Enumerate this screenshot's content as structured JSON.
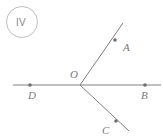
{
  "figure": {
    "label_badge": "IV",
    "kind": "geometry-angle-diagram",
    "stroke_color": "#808080",
    "label_color": "#7b7b7b",
    "badge_stroke_color": "#b9bfc9",
    "badge_text_color": "#8a8a8a",
    "background_color": "#ffffff"
  },
  "points": {
    "vertex": {
      "name": "O",
      "label": "O"
    },
    "left": {
      "name": "D",
      "label": "D"
    },
    "right": {
      "name": "B",
      "label": "B"
    },
    "upper_right": {
      "name": "A",
      "label": "A"
    },
    "lower_right": {
      "name": "C",
      "label": "C"
    }
  },
  "labels": {
    "o": "O",
    "d": "D",
    "b": "B",
    "a": "A",
    "c": "C"
  },
  "geometry": {
    "line_db": {
      "x1": 13,
      "y1": 85,
      "x2": 161,
      "y2": 85
    },
    "ray_oa": {
      "x1": 80,
      "y1": 85,
      "x2": 123,
      "y2": 23
    },
    "ray_oc": {
      "x1": 80,
      "y1": 85,
      "x2": 129,
      "y2": 131
    },
    "dot_d": {
      "cx": 30,
      "cy": 85,
      "r": 1.8
    },
    "dot_b": {
      "cx": 145,
      "cy": 85,
      "r": 1.8
    },
    "dot_a": {
      "cx": 115,
      "cy": 40,
      "r": 1.8
    },
    "dot_c": {
      "cx": 116,
      "cy": 121,
      "r": 1.8
    },
    "badge_circle": {
      "cx": 22,
      "cy": 22,
      "r": 15.5
    }
  },
  "label_positions": {
    "o": {
      "x": 70,
      "y": 78
    },
    "d": {
      "x": 28,
      "y": 99
    },
    "b": {
      "x": 141,
      "y": 99
    },
    "a": {
      "x": 123,
      "y": 51
    },
    "c": {
      "x": 102,
      "y": 134
    },
    "badge": {
      "x": 16,
      "y": 26
    }
  }
}
